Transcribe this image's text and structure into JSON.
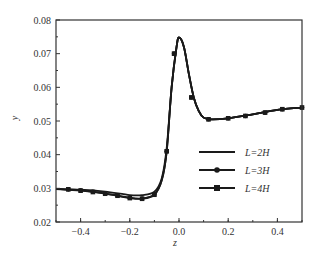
{
  "chart_data": {
    "type": "line",
    "title": "",
    "xlabel": "z",
    "ylabel": "y",
    "xlim": [
      -0.5,
      0.5
    ],
    "ylim": [
      0.02,
      0.08
    ],
    "x_ticks": [
      "-0.4",
      "-0.2",
      "0.0",
      "0.2",
      "0.4"
    ],
    "x_tick_values": [
      -0.4,
      -0.2,
      0.0,
      0.2,
      0.4
    ],
    "y_ticks": [
      "0.02",
      "0.03",
      "0.04",
      "0.05",
      "0.06",
      "0.07",
      "0.08"
    ],
    "y_tick_values": [
      0.02,
      0.03,
      0.04,
      0.05,
      0.06,
      0.07,
      0.08
    ],
    "grid": false,
    "legend_position": "center-right",
    "series": [
      {
        "name": "L=2H",
        "marker": "none",
        "x": [
          -0.5,
          -0.4,
          -0.3,
          -0.2,
          -0.15,
          -0.1,
          -0.07,
          -0.05,
          -0.03,
          -0.01,
          0.0,
          0.02,
          0.04,
          0.06,
          0.08,
          0.1,
          0.13,
          0.2,
          0.3,
          0.4,
          0.5
        ],
        "y": [
          0.0298,
          0.0296,
          0.029,
          0.028,
          0.028,
          0.029,
          0.033,
          0.042,
          0.06,
          0.072,
          0.0748,
          0.072,
          0.064,
          0.057,
          0.053,
          0.051,
          0.0505,
          0.0508,
          0.052,
          0.0533,
          0.054
        ]
      },
      {
        "name": "L=3H",
        "marker": "circle",
        "x": [
          -0.5,
          -0.4,
          -0.3,
          -0.2,
          -0.15,
          -0.1,
          -0.07,
          -0.05,
          -0.03,
          -0.01,
          0.0,
          0.02,
          0.04,
          0.06,
          0.08,
          0.1,
          0.13,
          0.2,
          0.3,
          0.4,
          0.5
        ],
        "y": [
          0.0298,
          0.0294,
          0.0285,
          0.0272,
          0.027,
          0.0282,
          0.0325,
          0.041,
          0.06,
          0.072,
          0.0748,
          0.072,
          0.064,
          0.057,
          0.053,
          0.051,
          0.0505,
          0.0508,
          0.052,
          0.0533,
          0.054
        ],
        "markers_x": [
          -0.45,
          -0.4,
          -0.35,
          -0.3,
          -0.25,
          -0.2,
          -0.15,
          -0.1,
          -0.05,
          -0.02,
          0.05,
          0.12,
          0.2,
          0.27,
          0.35,
          0.42,
          0.5
        ],
        "markers_y": [
          0.0297,
          0.0294,
          0.029,
          0.0285,
          0.0279,
          0.0272,
          0.027,
          0.0282,
          0.041,
          0.07,
          0.057,
          0.0505,
          0.0508,
          0.0515,
          0.0525,
          0.0535,
          0.054
        ]
      },
      {
        "name": "L=4H",
        "marker": "square",
        "x": [
          -0.5,
          -0.4,
          -0.3,
          -0.2,
          -0.15,
          -0.1,
          -0.07,
          -0.05,
          -0.03,
          -0.01,
          0.0,
          0.02,
          0.04,
          0.06,
          0.08,
          0.1,
          0.13,
          0.2,
          0.3,
          0.4,
          0.5
        ],
        "y": [
          0.0298,
          0.0293,
          0.0284,
          0.0271,
          0.0269,
          0.0281,
          0.0324,
          0.041,
          0.06,
          0.072,
          0.0748,
          0.072,
          0.064,
          0.057,
          0.053,
          0.051,
          0.0505,
          0.0508,
          0.052,
          0.0533,
          0.054
        ],
        "markers_x": [
          -0.45,
          -0.4,
          -0.35,
          -0.3,
          -0.25,
          -0.2,
          -0.15,
          -0.1,
          -0.05,
          -0.02,
          0.05,
          0.12,
          0.2,
          0.27,
          0.35,
          0.42,
          0.5
        ],
        "markers_y": [
          0.0297,
          0.0293,
          0.0289,
          0.0284,
          0.0278,
          0.0271,
          0.0269,
          0.0281,
          0.041,
          0.07,
          0.057,
          0.0505,
          0.0508,
          0.0515,
          0.0525,
          0.0535,
          0.054
        ]
      }
    ]
  },
  "legend": {
    "items": [
      {
        "label": "L=2H",
        "marker": "none"
      },
      {
        "label": "L=3H",
        "marker": "circle"
      },
      {
        "label": "L=4H",
        "marker": "square"
      }
    ]
  },
  "colors": {
    "line": "#1a1a1a",
    "axis": "#333333",
    "text": "#333333",
    "background": "#ffffff"
  }
}
